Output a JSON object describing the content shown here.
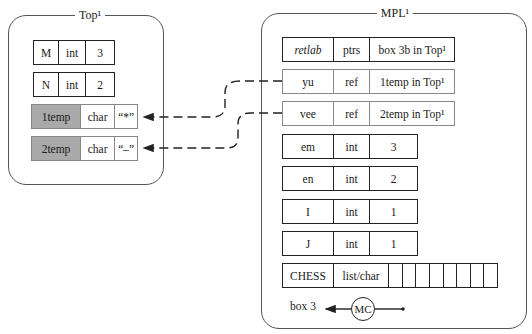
{
  "frames": {
    "top": {
      "title": "Top¹"
    },
    "mpl": {
      "title": "MPL¹"
    }
  },
  "top_rows": [
    {
      "name": "M",
      "type": "int",
      "value": "3",
      "shaded": false
    },
    {
      "name": "N",
      "type": "int",
      "value": "2",
      "shaded": false
    },
    {
      "name": "1temp",
      "type": "char",
      "value": "“*”",
      "shaded": true
    },
    {
      "name": "2temp",
      "type": "char",
      "value": "“–”",
      "shaded": true
    }
  ],
  "mpl_rows": [
    {
      "name": "retlab",
      "type": "ptrs",
      "value": "box 3b in Top¹",
      "italic_name": true
    },
    {
      "name": "yu",
      "type": "ref",
      "value": "1temp in Top¹",
      "light": true
    },
    {
      "name": "vee",
      "type": "ref",
      "value": "2temp in Top¹",
      "light": true
    },
    {
      "name": "em",
      "type": "int",
      "value": "3"
    },
    {
      "name": "en",
      "type": "int",
      "value": "2"
    },
    {
      "name": "I",
      "type": "int",
      "value": "1"
    },
    {
      "name": "J",
      "type": "int",
      "value": "1"
    },
    {
      "name": "CHESS",
      "type": "list/char",
      "list_cells": 8
    }
  ],
  "bottom": {
    "box_label": "box 3",
    "mc_label": "MC"
  },
  "connections": [
    {
      "from": "yu",
      "to": "1temp",
      "style": "dashed-arrow"
    },
    {
      "from": "vee",
      "to": "2temp",
      "style": "dashed-arrow"
    }
  ]
}
